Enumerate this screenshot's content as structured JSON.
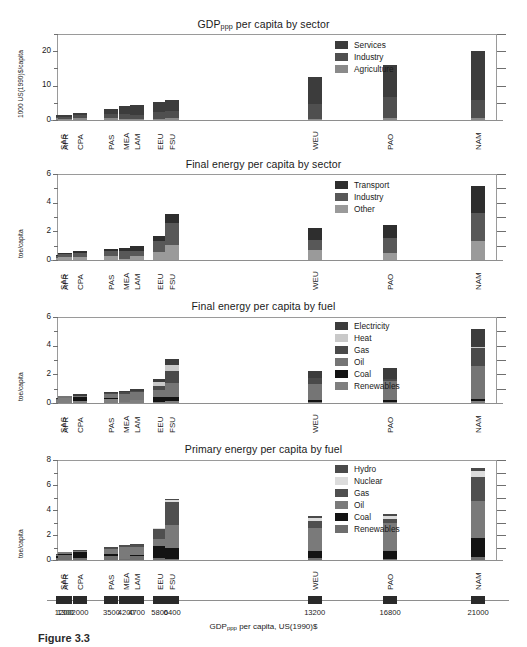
{
  "figure": {
    "caption": "Figure 3.3",
    "xaxis_title_main": "GDP",
    "xaxis_title_sub": "ppp",
    "xaxis_title_rest": " per capita, US(1990)$",
    "regions": [
      "SAS",
      "AFR",
      "CPA",
      "PAS",
      "MEA",
      "LAM",
      "EEU",
      "FSU",
      "WEU",
      "PAO",
      "NAM"
    ],
    "gdp_values": [
      "1200",
      "1300",
      "2000",
      "3500",
      "4200",
      "4700",
      "5800",
      "6400",
      "13200",
      "16800",
      "21000"
    ]
  },
  "colors": {
    "black": "#131313",
    "dark": "#3c3c3c",
    "darkgray": "#4f4f4f",
    "mid": "#6e6e6e",
    "midlight": "#8a8a8a",
    "light": "#c9c9c9",
    "lighter": "#dcdcdc",
    "axis": "#8e8e8e"
  },
  "chart_data": [
    {
      "id": "gdp-by-sector",
      "type": "bar",
      "stacked": true,
      "title_main": "GDP",
      "title_sub": "ppp",
      "title_rest": " per capita by sector",
      "ylabel": "1000 US(1990)$/capita",
      "ylim": [
        0,
        25
      ],
      "yticks": [
        0,
        10,
        20
      ],
      "yminor": [
        5,
        15,
        25
      ],
      "categories": [
        "SAS",
        "AFR",
        "CPA",
        "PAS",
        "MEA",
        "LAM",
        "EEU",
        "FSU",
        "WEU",
        "PAO",
        "NAM"
      ],
      "legend": [
        "Services",
        "Industry",
        "Agriculture"
      ],
      "legend_colors": [
        "#3c3c3c",
        "#4f4f4f",
        "#8a8a8a"
      ],
      "series": [
        {
          "name": "Agriculture",
          "color": "#8a8a8a",
          "values": [
            0.45,
            0.4,
            0.55,
            0.5,
            0.35,
            0.3,
            0.35,
            0.45,
            0.4,
            0.45,
            0.45
          ]
        },
        {
          "name": "Industry",
          "color": "#4f4f4f",
          "values": [
            0.45,
            0.45,
            1.0,
            1.3,
            1.45,
            1.2,
            2.05,
            2.2,
            4.3,
            6.3,
            5.4
          ]
        },
        {
          "name": "Services",
          "color": "#3c3c3c",
          "values": [
            0.5,
            0.65,
            0.55,
            1.5,
            2.2,
            3.0,
            2.9,
            3.15,
            7.9,
            9.25,
            14.35
          ]
        }
      ],
      "totals": [
        1.4,
        1.5,
        2.1,
        3.3,
        4.0,
        4.5,
        5.3,
        5.8,
        12.6,
        16.0,
        20.2
      ]
    },
    {
      "id": "final-energy-by-sector",
      "type": "bar",
      "stacked": true,
      "title_main": "",
      "title_sub": "",
      "title_rest": "Final energy per capita by sector",
      "ylabel": "toe/capita",
      "ylim": [
        0,
        6
      ],
      "yticks": [
        0,
        2,
        4,
        6
      ],
      "yminor": [
        1,
        3,
        5
      ],
      "categories": [
        "SAS",
        "AFR",
        "CPA",
        "PAS",
        "MEA",
        "LAM",
        "EEU",
        "FSU",
        "WEU",
        "PAO",
        "NAM"
      ],
      "legend": [
        "Transport",
        "Industry",
        "Other"
      ],
      "legend_colors": [
        "#2e2e2e",
        "#585858",
        "#9a9a9a"
      ],
      "series": [
        {
          "name": "Other",
          "color": "#9a9a9a",
          "values": [
            0.15,
            0.22,
            0.22,
            0.26,
            0.1,
            0.26,
            0.58,
            1.05,
            0.72,
            0.5,
            1.35
          ]
        },
        {
          "name": "Industry",
          "color": "#585858",
          "values": [
            0.14,
            0.2,
            0.3,
            0.34,
            0.55,
            0.38,
            0.75,
            1.5,
            0.7,
            1.05,
            1.95
          ]
        },
        {
          "name": "Transport",
          "color": "#2e2e2e",
          "values": [
            0.06,
            0.08,
            0.1,
            0.2,
            0.2,
            0.31,
            0.35,
            0.67,
            0.8,
            0.87,
            1.85
          ]
        }
      ],
      "totals": [
        0.35,
        0.5,
        0.62,
        0.8,
        0.85,
        0.95,
        1.68,
        3.22,
        2.22,
        2.42,
        5.15
      ]
    },
    {
      "id": "final-energy-by-fuel",
      "type": "bar",
      "stacked": true,
      "title_main": "",
      "title_sub": "",
      "title_rest": "Final energy per capita by fuel",
      "ylabel": "toe/capita",
      "ylim": [
        0,
        6
      ],
      "yticks": [
        0,
        2,
        4,
        6
      ],
      "yminor": [
        1,
        3,
        5
      ],
      "categories": [
        "SAS",
        "AFR",
        "CPA",
        "PAS",
        "MEA",
        "LAM",
        "EEU",
        "FSU",
        "WEU",
        "PAO",
        "NAM"
      ],
      "legend": [
        "Electricity",
        "Heat",
        "Gas",
        "Oil",
        "Coal",
        "Renewables"
      ],
      "legend_colors": [
        "#3c3c3c",
        "#c9c9c9",
        "#4a4a4a",
        "#757575",
        "#131313",
        "#7f7f7f"
      ],
      "series": [
        {
          "name": "Renewables",
          "color": "#7f7f7f",
          "values": [
            0.18,
            0.33,
            0.16,
            0.26,
            0.04,
            0.2,
            0.1,
            0.12,
            0.1,
            0.08,
            0.14
          ]
        },
        {
          "name": "Coal",
          "color": "#131313",
          "values": [
            0.05,
            0.04,
            0.25,
            0.1,
            0.02,
            0.04,
            0.35,
            0.32,
            0.1,
            0.12,
            0.12
          ]
        },
        {
          "name": "Oil",
          "color": "#757575",
          "values": [
            0.07,
            0.09,
            0.1,
            0.29,
            0.58,
            0.55,
            0.47,
            0.95,
            1.1,
            1.35,
            2.35
          ]
        },
        {
          "name": "Gas",
          "color": "#4a4a4a",
          "values": [
            0.01,
            0.01,
            0.01,
            0.04,
            0.1,
            0.04,
            0.3,
            0.85,
            0.45,
            0.15,
            1.25
          ]
        },
        {
          "name": "Heat",
          "color": "#c9c9c9",
          "values": [
            0.0,
            0.0,
            0.0,
            0.0,
            0.0,
            0.0,
            0.22,
            0.42,
            0.02,
            0.0,
            0.02
          ]
        },
        {
          "name": "Electricity",
          "color": "#3c3c3c",
          "values": [
            0.04,
            0.04,
            0.1,
            0.11,
            0.12,
            0.12,
            0.26,
            0.38,
            0.45,
            0.72,
            1.27
          ]
        }
      ],
      "totals": [
        0.35,
        0.51,
        0.62,
        0.8,
        0.86,
        0.95,
        1.7,
        3.04,
        2.22,
        2.42,
        5.15
      ]
    },
    {
      "id": "primary-energy-by-fuel",
      "type": "bar",
      "stacked": true,
      "title_main": "",
      "title_sub": "",
      "title_rest": "Primary energy per capita by fuel",
      "ylabel": "toe/capita",
      "ylim": [
        0,
        8
      ],
      "yticks": [
        0,
        2,
        4,
        6,
        8
      ],
      "yminor": [
        1,
        3,
        5,
        7
      ],
      "categories": [
        "SAS",
        "AFR",
        "CPA",
        "PAS",
        "MEA",
        "LAM",
        "EEU",
        "FSU",
        "WEU",
        "PAO",
        "NAM"
      ],
      "legend": [
        "Hydro",
        "Nuclear",
        "Gas",
        "Oil",
        "Coal",
        "Renewables"
      ],
      "legend_colors": [
        "#4a4a4a",
        "#dcdcdc",
        "#4f4f4f",
        "#7a7a7a",
        "#131313",
        "#6e6e6e"
      ],
      "series": [
        {
          "name": "Renewables",
          "color": "#6e6e6e",
          "values": [
            0.2,
            0.4,
            0.2,
            0.3,
            0.05,
            0.3,
            0.15,
            0.12,
            0.2,
            0.12,
            0.25
          ]
        },
        {
          "name": "Coal",
          "color": "#131313",
          "values": [
            0.12,
            0.1,
            0.42,
            0.2,
            0.04,
            0.08,
            1.0,
            0.85,
            0.52,
            0.58,
            1.52
          ]
        },
        {
          "name": "Oil",
          "color": "#7a7a7a",
          "values": [
            0.1,
            0.12,
            0.12,
            0.4,
            0.95,
            0.7,
            0.55,
            1.85,
            1.85,
            2.3,
            2.95
          ]
        },
        {
          "name": "Gas",
          "color": "#4f4f4f",
          "values": [
            0.02,
            0.02,
            0.02,
            0.08,
            0.16,
            0.12,
            0.75,
            1.85,
            0.55,
            0.25,
            1.95
          ]
        },
        {
          "name": "Nuclear",
          "color": "#dcdcdc",
          "values": [
            0.0,
            0.0,
            0.0,
            0.0,
            0.0,
            0.02,
            0.1,
            0.12,
            0.28,
            0.3,
            0.45
          ]
        },
        {
          "name": "Hydro",
          "color": "#4a4a4a",
          "values": [
            0.02,
            0.02,
            0.02,
            0.04,
            0.02,
            0.1,
            0.05,
            0.06,
            0.12,
            0.1,
            0.28
          ]
        }
      ],
      "totals": [
        0.46,
        0.66,
        0.78,
        1.02,
        1.22,
        1.32,
        2.6,
        4.85,
        3.52,
        3.65,
        7.4
      ]
    }
  ]
}
